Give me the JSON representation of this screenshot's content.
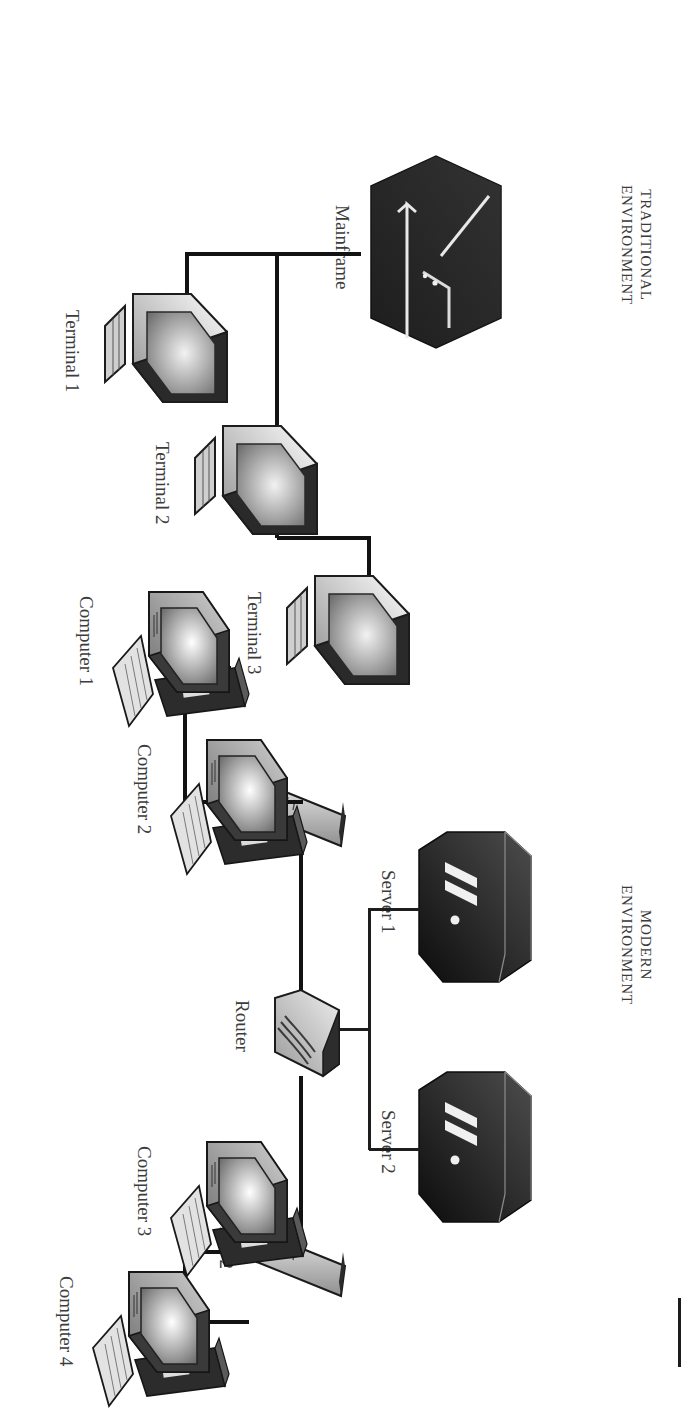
{
  "diagram": {
    "sections": [
      {
        "id": "traditional",
        "header": "TRADITIONAL\nENVIRONMENT",
        "nodes": [
          {
            "id": "mainframe",
            "label": "Mainframe",
            "type": "mainframe-icon"
          },
          {
            "id": "terminal1",
            "label": "Terminal 1",
            "type": "terminal-icon"
          },
          {
            "id": "terminal2",
            "label": "Terminal 2",
            "type": "terminal-icon"
          },
          {
            "id": "terminal3",
            "label": "Terminal 3",
            "type": "terminal-icon"
          }
        ],
        "links": [
          {
            "from": "mainframe",
            "to": "terminal1"
          },
          {
            "from": "mainframe",
            "to": "terminal2"
          },
          {
            "from": "mainframe",
            "to": "terminal3"
          }
        ]
      },
      {
        "id": "modern",
        "header": "MODERN\nENVIRONMENT",
        "nodes": [
          {
            "id": "server1",
            "label": "Server 1",
            "type": "server-icon"
          },
          {
            "id": "server2",
            "label": "Server 2",
            "type": "server-icon"
          },
          {
            "id": "router",
            "label": "Router",
            "type": "router-icon"
          },
          {
            "id": "switch1",
            "label": "Switch 1",
            "type": "switch-icon"
          },
          {
            "id": "switch2",
            "label": "Switch 2",
            "type": "switch-icon"
          },
          {
            "id": "computer1",
            "label": "Computer 1",
            "type": "computer-icon"
          },
          {
            "id": "computer2",
            "label": "Computer 2",
            "type": "computer-icon"
          },
          {
            "id": "computer3",
            "label": "Computer 3",
            "type": "computer-icon"
          },
          {
            "id": "computer4",
            "label": "Computer 4",
            "type": "computer-icon"
          }
        ],
        "links": [
          {
            "from": "server1",
            "to": "router"
          },
          {
            "from": "server2",
            "to": "router"
          },
          {
            "from": "router",
            "to": "switch1"
          },
          {
            "from": "router",
            "to": "switch2"
          },
          {
            "from": "switch1",
            "to": "computer1"
          },
          {
            "from": "switch1",
            "to": "computer2"
          },
          {
            "from": "switch2",
            "to": "computer3"
          },
          {
            "from": "switch2",
            "to": "computer4"
          }
        ]
      }
    ],
    "colors": {
      "ink": "#1d1d1d",
      "label": "#3c3c3c",
      "header": "#3a3a3a",
      "page": "#ffffff",
      "device_dark": "#262626",
      "device_light": "#d6d6d6"
    }
  }
}
